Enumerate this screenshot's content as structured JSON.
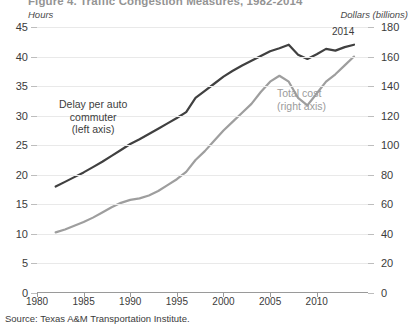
{
  "title": "Figure 4. Traffic Congestion Measures, 1982-2014",
  "axes": {
    "left_unit": "Hours",
    "right_unit": "Dollars (billions)",
    "left_ticks": [
      45,
      40,
      35,
      30,
      25,
      20,
      15,
      10,
      5,
      0
    ],
    "right_ticks": [
      180,
      160,
      140,
      120,
      100,
      80,
      60,
      40,
      20,
      0
    ],
    "x_ticks": [
      1980,
      1985,
      1990,
      1995,
      2000,
      2005,
      2010
    ]
  },
  "annotations": {
    "delay_label_line1": "Delay per auto",
    "delay_label_line2": "commuter",
    "delay_label_line3": "(left axis)",
    "cost_label_line1": "Total cost",
    "cost_label_line2": "(right axis)",
    "end_year": "2014"
  },
  "source": "Source: Texas A&M Transportation Institute.",
  "colors": {
    "delay_line": "#404040",
    "cost_line": "#9e9e9e",
    "grid": "#e9e9e9",
    "axis": "#9a9a9a",
    "text": "#3b3b3b"
  },
  "chart_data": {
    "type": "line",
    "title": "Figure 4. Traffic Congestion Measures, 1982-2014",
    "xlabel": "",
    "ylabel": "Hours",
    "y2label": "Dollars (billions)",
    "xlim": [
      1980,
      2015.5
    ],
    "ylim": [
      0,
      45
    ],
    "y2lim": [
      0,
      180
    ],
    "grid": true,
    "legend": "inline-annotations",
    "x": [
      1982,
      1983,
      1984,
      1985,
      1986,
      1987,
      1988,
      1989,
      1990,
      1991,
      1992,
      1993,
      1994,
      1995,
      1996,
      1997,
      1998,
      1999,
      2000,
      2001,
      2002,
      2003,
      2004,
      2005,
      2006,
      2007,
      2008,
      2009,
      2010,
      2011,
      2012,
      2013,
      2014
    ],
    "series": [
      {
        "name": "Delay per auto commuter (left axis)",
        "axis": "left",
        "unit": "hours",
        "color": "#404040",
        "values": [
          18.0,
          18.8,
          19.6,
          20.4,
          21.3,
          22.2,
          23.2,
          24.2,
          25.2,
          26.0,
          26.9,
          27.8,
          28.7,
          29.6,
          30.6,
          33.0,
          34.2,
          35.4,
          36.6,
          37.6,
          38.5,
          39.3,
          40.1,
          40.9,
          41.4,
          42.0,
          40.3,
          39.6,
          40.4,
          41.3,
          41.0,
          41.6,
          42.0
        ]
      },
      {
        "name": "Total cost (right axis)",
        "axis": "right",
        "unit": "billions of dollars",
        "color": "#9e9e9e",
        "values": [
          41.0,
          43.0,
          45.5,
          48.0,
          51.0,
          54.5,
          58.0,
          61.0,
          63.0,
          64.0,
          66.0,
          69.0,
          73.0,
          77.0,
          82.0,
          90.0,
          96.0,
          103.0,
          110.0,
          116.0,
          122.0,
          128.0,
          136.0,
          143.0,
          147.0,
          143.0,
          132.0,
          127.0,
          135.0,
          143.0,
          148.0,
          154.0,
          160.0
        ]
      }
    ]
  }
}
